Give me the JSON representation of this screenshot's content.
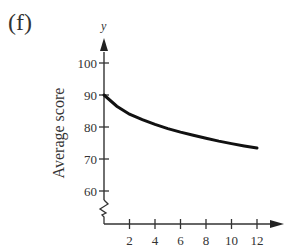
{
  "panel_label": "(f)",
  "chart_data": {
    "type": "line",
    "title": "",
    "xlabel": "",
    "ylabel": "Average score",
    "y_axis_letter": "y",
    "xlim": [
      0,
      13
    ],
    "ylim": [
      55,
      105
    ],
    "y_axis_break": true,
    "grid": false,
    "x_ticks": [
      2,
      4,
      6,
      8,
      10,
      12
    ],
    "x_tick_labels": [
      "2",
      "4",
      "6",
      "8",
      "10",
      "12"
    ],
    "y_ticks": [
      60,
      70,
      80,
      90,
      100
    ],
    "y_tick_labels": [
      "60",
      "70",
      "80",
      "90",
      "100"
    ],
    "series": [
      {
        "name": "Average score",
        "x": [
          0,
          1,
          2,
          3,
          4,
          5,
          6,
          7,
          8,
          9,
          10,
          11,
          12
        ],
        "y": [
          90,
          86.5,
          84,
          82.3,
          80.8,
          79.5,
          78.4,
          77.4,
          76.5,
          75.6,
          74.8,
          74.1,
          73.4
        ]
      }
    ],
    "colors": {
      "curve": "#111111",
      "axes": "#333333"
    }
  }
}
